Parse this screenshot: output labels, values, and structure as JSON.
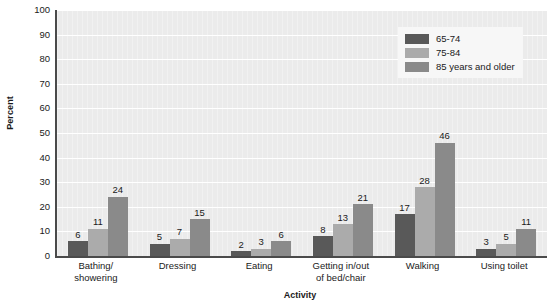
{
  "chart_data": {
    "type": "bar",
    "title": "",
    "xlabel": "Activity",
    "ylabel": "Percent",
    "ylim": [
      0,
      100
    ],
    "yticks": [
      0,
      10,
      20,
      30,
      40,
      50,
      60,
      70,
      80,
      90,
      100
    ],
    "grid": true,
    "legend_position": "top-right",
    "categories": [
      "Bathing/\nshowering",
      "Dressing",
      "Eating",
      "Getting in/out\nof bed/chair",
      "Walking",
      "Using toilet"
    ],
    "series": [
      {
        "name": "65-74",
        "color": "#595959",
        "values": [
          6,
          5,
          2,
          8,
          17,
          3
        ]
      },
      {
        "name": "75-84",
        "color": "#ababab",
        "values": [
          11,
          7,
          3,
          13,
          28,
          5
        ]
      },
      {
        "name": "85 years and older",
        "color": "#8a8a8a",
        "values": [
          24,
          15,
          6,
          21,
          46,
          11
        ]
      }
    ]
  },
  "colors": {
    "plot_background": "#ebebeb",
    "gridline": "#ffffff",
    "axis": "#4a4a4a",
    "text": "#1a1a1a",
    "legend_background": "#f7f7f7"
  }
}
